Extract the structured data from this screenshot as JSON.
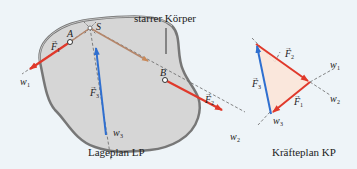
{
  "lageplan": {
    "caption": "Lageplan LP",
    "body_label": "starrer Körper",
    "points": {
      "A": "A",
      "B": "B",
      "S": "S"
    },
    "forces": {
      "F1": "F",
      "F2": "F",
      "F3": "F"
    },
    "force_subscripts": {
      "F1": "1",
      "F2": "2",
      "F3": "3"
    },
    "lines": {
      "w1": "w",
      "w2": "w",
      "w3": "w"
    },
    "line_subscripts": {
      "w1": "1",
      "w2": "2",
      "w3": "3"
    }
  },
  "kraefteplan": {
    "caption": "Kräfteplan KP",
    "forces": {
      "F1": "F",
      "F2": "F",
      "F3": "F"
    },
    "force_subscripts": {
      "F1": "1",
      "F2": "2",
      "F3": "3"
    },
    "lines": {
      "w1": "w",
      "w2": "w",
      "w3": "w"
    },
    "line_subscripts": {
      "w1": "1",
      "w2": "2",
      "w3": "3"
    }
  },
  "colors": {
    "background": "#eef4f8",
    "body_fill": "#d6d6d6",
    "body_outline": "#777777",
    "force_red": "#e0392b",
    "force_blue": "#2f6fd0",
    "line_of_action": "#8a7a70",
    "triangle_fill": "#fbe6d8"
  }
}
